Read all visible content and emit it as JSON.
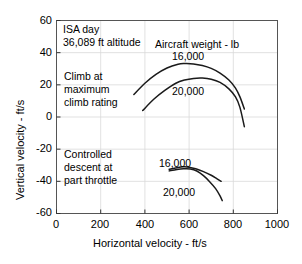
{
  "chart_data": {
    "type": "line",
    "title": "",
    "xlabel": "Horizontal velocity - ft/s",
    "ylabel": "Vertical velocity - ft/s",
    "xlim": [
      0,
      1000
    ],
    "ylim": [
      -60,
      60
    ],
    "xticks": [
      "0",
      "200",
      "400",
      "600",
      "800",
      "1000"
    ],
    "yticks": [
      "60",
      "40",
      "20",
      "0",
      "-20",
      "-40",
      "-60"
    ],
    "grid": true,
    "legend_position": "none",
    "line_color": "#1a1a1a",
    "grid_color": "#d9d9d9",
    "frame_color": "#555555",
    "annotations": {
      "conditions_line1": "ISA day",
      "conditions_line2": "36,089 ft altitude",
      "weight_header": "Aircraft weight - lb",
      "climb_line1": "Climb at",
      "climb_line2": "maximum",
      "climb_line3": "climb rating",
      "descent_line1": "Controlled",
      "descent_line2": "descent at",
      "descent_line3": "part throttle"
    },
    "series": [
      {
        "name": "Climb at maximum climb rating, 16,000 lb",
        "label": "16,000",
        "x": [
          350,
          400,
          450,
          500,
          550,
          580,
          620,
          660,
          700,
          740,
          780,
          810,
          830,
          850
        ],
        "y": [
          14,
          21,
          26.5,
          30.5,
          32.8,
          33.2,
          33.0,
          32.0,
          30.2,
          27.3,
          23.0,
          18.0,
          12.5,
          5.0
        ]
      },
      {
        "name": "Climb at maximum climb rating, 20,000 lb",
        "label": "20,000",
        "x": [
          390,
          440,
          490,
          540,
          580,
          620,
          660,
          700,
          740,
          780,
          810,
          830,
          850
        ],
        "y": [
          4,
          11,
          16.5,
          21.0,
          23.0,
          24.0,
          24.2,
          23.5,
          21.5,
          17.5,
          12.5,
          6.0,
          -6.0
        ]
      },
      {
        "name": "Controlled descent at part throttle, 16,000 lb",
        "label": "16,000",
        "x": [
          510,
          545,
          575,
          600,
          630,
          665,
          700,
          725,
          745
        ],
        "y": [
          -32.5,
          -31.5,
          -31.0,
          -31.2,
          -32.2,
          -34.0,
          -36.2,
          -38.3,
          -40.0
        ]
      },
      {
        "name": "Controlled descent at part throttle, 20,000 lb",
        "label": "20,000",
        "x": [
          510,
          545,
          575,
          605,
          635,
          665,
          695,
          720,
          740,
          750
        ],
        "y": [
          -33.5,
          -32.6,
          -32.2,
          -32.3,
          -33.6,
          -36.5,
          -40.5,
          -44.5,
          -49.0,
          -52.0
        ]
      }
    ]
  }
}
